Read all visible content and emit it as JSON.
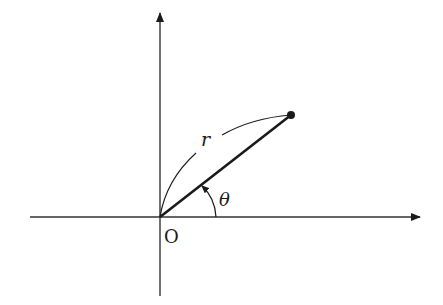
{
  "diagram": {
    "origin_label": "O",
    "radius_label": "r",
    "angle_label": "θ",
    "colors": {
      "stroke": "#1a1a1a",
      "axis": "#333333",
      "background": "#ffffff"
    },
    "geometry": {
      "origin": [
        160,
        217
      ],
      "point": [
        291,
        115
      ],
      "x_axis": [
        30,
        420
      ],
      "y_axis": [
        12,
        296
      ]
    }
  }
}
